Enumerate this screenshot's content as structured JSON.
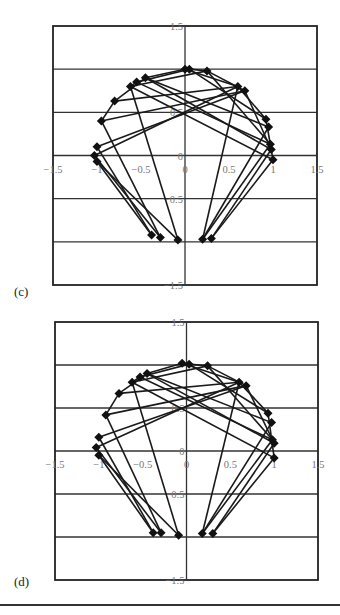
{
  "chart_data": [
    {
      "type": "line",
      "panel_label": "(c)",
      "title": "",
      "xlabel": "",
      "ylabel": "",
      "xlim": [
        -1.5,
        1.5
      ],
      "ylim": [
        -1.5,
        1.5
      ],
      "x_ticks": [
        "-1.5",
        "-1",
        "-0.5",
        "0",
        "0.5",
        "1",
        "1.5"
      ],
      "y_ticks": [
        "1.5",
        "1",
        "0.5",
        "0",
        "-0.5",
        "-1",
        "-1.5"
      ],
      "grid": "horizontal",
      "marker": "diamond",
      "points": [
        [
          0.0,
          1.0
        ],
        [
          0.05,
          1.0
        ],
        [
          0.25,
          0.98
        ],
        [
          -0.45,
          0.9
        ],
        [
          -0.55,
          0.85
        ],
        [
          -0.62,
          0.8
        ],
        [
          -0.8,
          0.63
        ],
        [
          -0.95,
          0.4
        ],
        [
          0.6,
          0.8
        ],
        [
          0.68,
          0.75
        ],
        [
          0.92,
          0.42
        ],
        [
          0.95,
          0.33
        ],
        [
          0.97,
          0.13
        ],
        [
          0.98,
          0.07
        ],
        [
          1.0,
          -0.05
        ],
        [
          -1.0,
          0.1
        ],
        [
          -1.03,
          0.0
        ],
        [
          -1.0,
          -0.07
        ],
        [
          -0.38,
          -0.92
        ],
        [
          -0.28,
          -0.95
        ],
        [
          -0.08,
          -0.98
        ],
        [
          0.2,
          -0.97
        ],
        [
          0.3,
          -0.96
        ]
      ],
      "edges": [
        [
          0,
          3
        ],
        [
          0,
          8
        ],
        [
          1,
          4
        ],
        [
          1,
          10
        ],
        [
          2,
          5
        ],
        [
          2,
          9
        ],
        [
          2,
          12
        ],
        [
          3,
          11
        ],
        [
          3,
          13
        ],
        [
          4,
          12
        ],
        [
          5,
          14
        ],
        [
          5,
          20
        ],
        [
          6,
          8
        ],
        [
          6,
          3
        ],
        [
          7,
          9
        ],
        [
          7,
          19
        ],
        [
          8,
          21
        ],
        [
          8,
          10
        ],
        [
          9,
          13
        ],
        [
          9,
          15
        ],
        [
          8,
          16
        ],
        [
          10,
          14
        ],
        [
          12,
          21
        ],
        [
          13,
          22
        ],
        [
          14,
          22
        ],
        [
          15,
          18
        ],
        [
          16,
          19
        ],
        [
          17,
          20
        ],
        [
          17,
          18
        ],
        [
          7,
          6
        ],
        [
          0,
          1
        ],
        [
          1,
          2
        ],
        [
          4,
          5
        ],
        [
          21,
          11
        ]
      ]
    },
    {
      "type": "line",
      "panel_label": "(d)",
      "title": "",
      "xlabel": "",
      "ylabel": "",
      "xlim": [
        -1.5,
        1.5
      ],
      "ylim": [
        -1.5,
        1.5
      ],
      "x_ticks": [
        "-1.5",
        "-1",
        "-0.5",
        "0",
        "0.5",
        "1",
        "1.5"
      ],
      "y_ticks": [
        "1.5",
        "1",
        "0.5",
        "0",
        "-0.5",
        "-1",
        "-1.5"
      ],
      "grid": "horizontal",
      "marker": "diamond",
      "points": [
        [
          -0.05,
          1.02
        ],
        [
          0.03,
          1.01
        ],
        [
          0.24,
          0.99
        ],
        [
          -0.45,
          0.9
        ],
        [
          -0.53,
          0.86
        ],
        [
          -0.62,
          0.8
        ],
        [
          -0.77,
          0.67
        ],
        [
          -0.92,
          0.42
        ],
        [
          0.6,
          0.8
        ],
        [
          0.68,
          0.76
        ],
        [
          0.93,
          0.44
        ],
        [
          0.97,
          0.33
        ],
        [
          0.98,
          0.13
        ],
        [
          1.0,
          0.09
        ],
        [
          1.0,
          -0.08
        ],
        [
          -1.0,
          0.16
        ],
        [
          -1.03,
          0.04
        ],
        [
          -1.0,
          -0.05
        ],
        [
          -0.38,
          -0.95
        ],
        [
          -0.29,
          -0.95
        ],
        [
          -0.09,
          -0.98
        ],
        [
          0.18,
          -0.96
        ],
        [
          0.3,
          -0.96
        ]
      ],
      "edges": [
        [
          0,
          3
        ],
        [
          0,
          8
        ],
        [
          1,
          4
        ],
        [
          1,
          10
        ],
        [
          2,
          5
        ],
        [
          2,
          9
        ],
        [
          2,
          12
        ],
        [
          3,
          11
        ],
        [
          3,
          13
        ],
        [
          4,
          12
        ],
        [
          5,
          14
        ],
        [
          5,
          20
        ],
        [
          6,
          8
        ],
        [
          6,
          3
        ],
        [
          7,
          9
        ],
        [
          7,
          19
        ],
        [
          8,
          21
        ],
        [
          8,
          10
        ],
        [
          9,
          13
        ],
        [
          9,
          15
        ],
        [
          8,
          16
        ],
        [
          10,
          14
        ],
        [
          12,
          21
        ],
        [
          13,
          22
        ],
        [
          14,
          22
        ],
        [
          15,
          18
        ],
        [
          16,
          19
        ],
        [
          17,
          20
        ],
        [
          17,
          18
        ],
        [
          7,
          6
        ],
        [
          0,
          1
        ],
        [
          1,
          2
        ],
        [
          4,
          5
        ],
        [
          21,
          11
        ]
      ]
    }
  ],
  "panels": [
    {
      "label": "(c)"
    },
    {
      "label": "(d)"
    }
  ]
}
